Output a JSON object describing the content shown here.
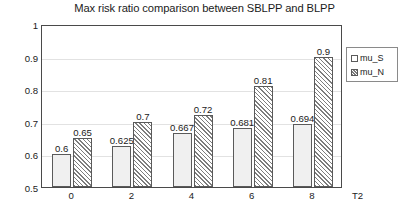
{
  "chart_data": {
    "type": "bar",
    "title": "Max risk ratio comparison between SBLPP and BLPP",
    "xlabel": "T2",
    "ylabel": "",
    "categories": [
      "0",
      "2",
      "4",
      "6",
      "8"
    ],
    "series": [
      {
        "name": "mu_S",
        "values": [
          0.6,
          0.625,
          0.667,
          0.681,
          0.694
        ]
      },
      {
        "name": "mu_N",
        "values": [
          0.65,
          0.7,
          0.72,
          0.81,
          0.9
        ]
      }
    ],
    "value_labels": [
      [
        "0.6",
        "0.625",
        "0.667",
        "0.681",
        "0.694"
      ],
      [
        "0.65",
        "0.7",
        "0.72",
        "0.81",
        "0.9"
      ]
    ],
    "ylim": [
      0.5,
      1
    ],
    "yticks": [
      0.5,
      0.6,
      0.7,
      0.8,
      0.9,
      1
    ],
    "ytick_labels": [
      "0.5",
      "0.6",
      "0.7",
      "0.8",
      "0.9",
      "1"
    ],
    "grid": true,
    "legend_position": "right",
    "colors": {
      "series_0": "#f0f0f0",
      "series_1": "#ffffff",
      "hatch": "#7d7d7d",
      "border": "#5a5a5a",
      "gridline": "#e2e2e2",
      "axis": "#4a4a4a",
      "text": "#1b1b1b",
      "background": "#ffffff"
    }
  },
  "legend": {
    "items": [
      {
        "label": "mu_S"
      },
      {
        "label": "mu_N"
      }
    ]
  }
}
